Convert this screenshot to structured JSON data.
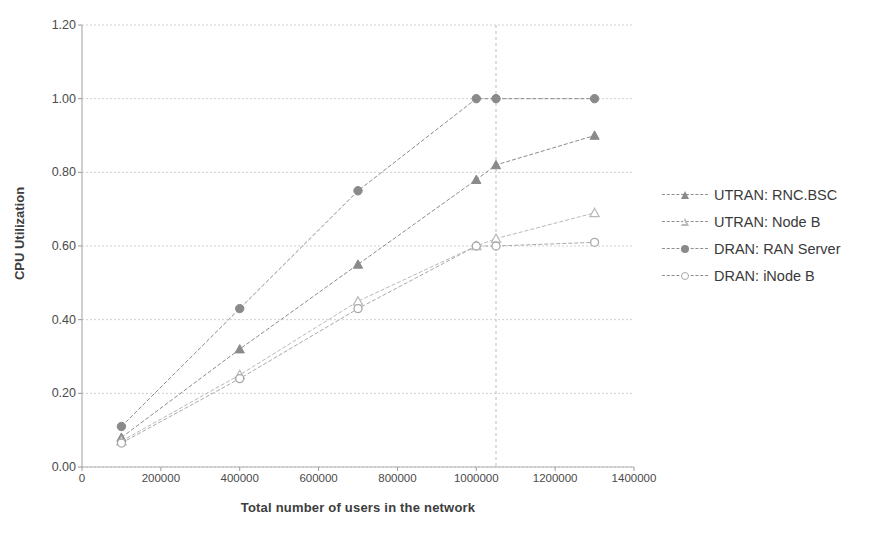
{
  "chart_data": {
    "type": "line",
    "title": "",
    "xlabel": "Total number of users in the network",
    "ylabel": "CPU Utilization",
    "xlim": [
      0,
      1400000
    ],
    "ylim": [
      0.0,
      1.2
    ],
    "xticks": [
      "0",
      "200000",
      "400000",
      "600000",
      "800000",
      "1000000",
      "1200000",
      "1400000"
    ],
    "xtick_values": [
      0,
      200000,
      400000,
      600000,
      800000,
      1000000,
      1200000,
      1400000
    ],
    "yticks": [
      "0.00",
      "0.20",
      "0.40",
      "0.60",
      "0.80",
      "1.00",
      "1.20"
    ],
    "ytick_values": [
      0.0,
      0.2,
      0.4,
      0.6,
      0.8,
      1.0,
      1.2
    ],
    "grid": true,
    "legend_position": "right",
    "series": [
      {
        "name": "UTRAN: RNC.BSC",
        "marker": "triangle-filled",
        "color": "#8a8a8a",
        "x": [
          100000,
          400000,
          700000,
          1000000,
          1050000,
          1300000
        ],
        "y": [
          0.08,
          0.32,
          0.55,
          0.78,
          0.82,
          0.9
        ]
      },
      {
        "name": "UTRAN: Node B",
        "marker": "triangle-open",
        "color": "#b9b9b9",
        "x": [
          100000,
          400000,
          700000,
          1000000,
          1050000,
          1300000
        ],
        "y": [
          0.07,
          0.25,
          0.45,
          0.6,
          0.62,
          0.69
        ]
      },
      {
        "name": "DRAN: RAN Server",
        "marker": "circle-filled",
        "color": "#8a8a8a",
        "x": [
          100000,
          400000,
          700000,
          1000000,
          1050000,
          1300000
        ],
        "y": [
          0.11,
          0.43,
          0.75,
          1.0,
          1.0,
          1.0
        ]
      },
      {
        "name": "DRAN: iNode B",
        "marker": "circle-open",
        "color": "#a9a9a9",
        "x": [
          100000,
          400000,
          700000,
          1000000,
          1050000,
          1300000
        ],
        "y": [
          0.065,
          0.24,
          0.43,
          0.6,
          0.6,
          0.61
        ]
      }
    ],
    "annotations": [
      {
        "type": "vertical-gridline",
        "x": 1050000
      }
    ]
  },
  "legend": {
    "items": [
      {
        "label": "UTRAN: RNC.BSC",
        "marker": "triangle-filled"
      },
      {
        "label": "UTRAN: Node B",
        "marker": "triangle-open"
      },
      {
        "label": "DRAN: RAN Server",
        "marker": "circle-filled"
      },
      {
        "label": "DRAN: iNode B",
        "marker": "circle-open"
      }
    ]
  }
}
